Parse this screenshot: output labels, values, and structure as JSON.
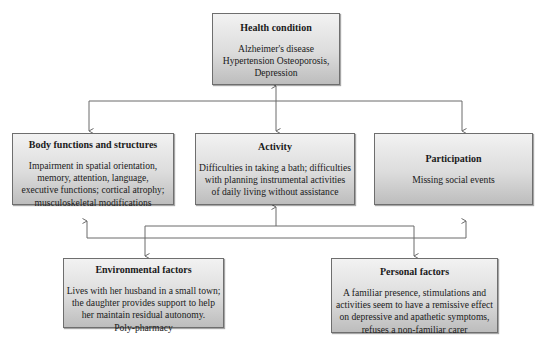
{
  "diagram": {
    "type": "ICF model case diagram",
    "nodes": {
      "health_condition": {
        "title": "Health condition",
        "lines": [
          "Alzheimer's disease",
          "Hypertension Osteoporosis,",
          "Depression"
        ]
      },
      "body_functions": {
        "title": "Body functions and structures",
        "lines": [
          "Impairment in spatial orientation,",
          "memory, attention, language,",
          "executive functions; cortical atrophy;",
          "musculoskeletal modifications"
        ]
      },
      "activity": {
        "title": "Activity",
        "lines": [
          "Difficulties in taking a bath; difficulties",
          "with planning instrumental activities",
          "of daily living without assistance"
        ]
      },
      "participation": {
        "title": "Participation",
        "lines": [
          "Missing social events"
        ]
      },
      "environmental_factors": {
        "title": "Environmental factors",
        "lines": [
          "Lives with her husband in a small town;",
          "the daughter provides support to help",
          "her maintain residual autonomy.",
          "Poly-pharmacy"
        ]
      },
      "personal_factors": {
        "title": "Personal factors",
        "lines": [
          "A familiar presence, stimulations and",
          "activities seem to have a remissive effect",
          "on depressive and apathetic symptoms,",
          "refuses a non-familiar carer"
        ]
      }
    },
    "edges": [
      {
        "from": "health_condition",
        "to": "activity",
        "bidirectional": true
      },
      {
        "from": "health_condition",
        "to": "body_functions"
      },
      {
        "from": "health_condition",
        "to": "participation"
      },
      {
        "from": "activity",
        "to": "environmental_factors"
      },
      {
        "from": "activity",
        "to": "personal_factors"
      },
      {
        "from": "contextual_factors",
        "to": "activity"
      },
      {
        "from": "contextual_factors",
        "to": "body_functions"
      },
      {
        "from": "contextual_factors",
        "to": "participation"
      }
    ],
    "colors": {
      "line": "#6a6a6a",
      "box_border": "#6e6e6e",
      "box_top": "#f2f2f2",
      "box_bottom": "#bdbdbd"
    }
  }
}
